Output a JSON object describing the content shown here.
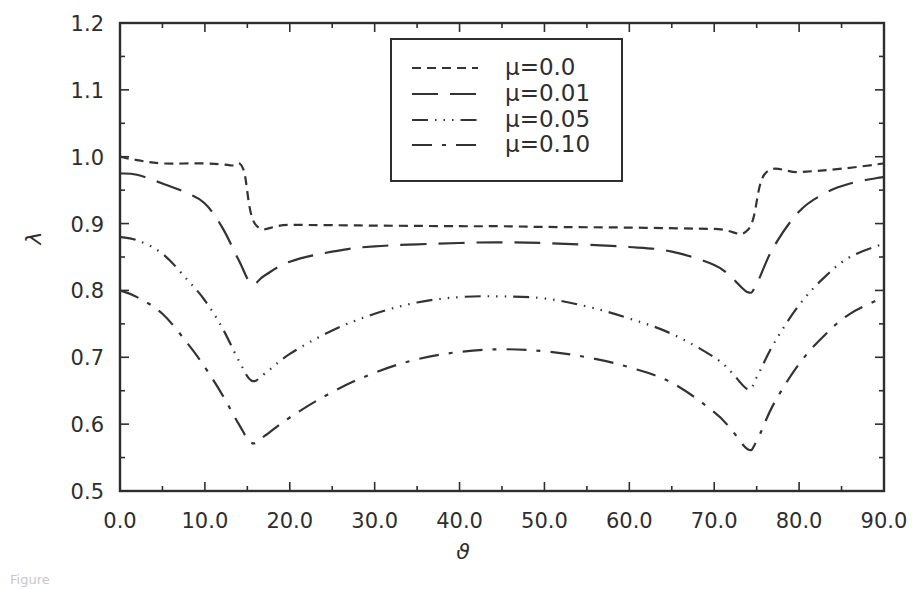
{
  "chart_data": {
    "type": "line",
    "title": "",
    "xlabel": "ϑ",
    "ylabel": "λ",
    "xlim": [
      0.0,
      90.0
    ],
    "ylim": [
      0.5,
      1.2
    ],
    "grid": false,
    "legend_position": "upper center (boxed)",
    "x_ticks": [
      "0.0",
      "10.0",
      "20.0",
      "30.0",
      "40.0",
      "50.0",
      "60.0",
      "70.0",
      "80.0",
      "90.0"
    ],
    "y_ticks": [
      "0.5",
      "0.6",
      "0.7",
      "0.8",
      "0.9",
      "1.0",
      "1.1",
      "1.2"
    ],
    "series": [
      {
        "name": "μ=0.0",
        "style": "short-dash",
        "dash": "9 6",
        "x": [
          0,
          2,
          5,
          10,
          13,
          14.5,
          16,
          20,
          30,
          40,
          45,
          50,
          60,
          70,
          74,
          76,
          80,
          85,
          90
        ],
        "y": [
          1.0,
          0.995,
          0.99,
          0.99,
          0.987,
          0.982,
          0.898,
          0.898,
          0.897,
          0.896,
          0.896,
          0.895,
          0.894,
          0.892,
          0.891,
          0.975,
          0.977,
          0.982,
          0.99
        ]
      },
      {
        "name": "μ=0.01",
        "style": "long-dash",
        "dash": "26 12",
        "x": [
          0,
          2,
          5,
          8,
          10,
          12,
          14,
          15.5,
          17,
          20,
          25,
          30,
          40,
          45,
          50,
          60,
          65,
          70,
          72,
          74,
          75,
          77,
          80,
          83,
          86,
          90
        ],
        "y": [
          0.975,
          0.973,
          0.96,
          0.945,
          0.93,
          0.895,
          0.845,
          0.81,
          0.822,
          0.843,
          0.858,
          0.866,
          0.871,
          0.872,
          0.871,
          0.865,
          0.858,
          0.838,
          0.82,
          0.797,
          0.81,
          0.865,
          0.918,
          0.945,
          0.96,
          0.97
        ]
      },
      {
        "name": "μ=0.05",
        "style": "dash-dot-dot",
        "dash": "16 7 1.5 7 1.5 7 1.5 7",
        "x": [
          0,
          2,
          5,
          8,
          10,
          12,
          14,
          15.5,
          17,
          20,
          25,
          30,
          35,
          40,
          45,
          50,
          55,
          60,
          65,
          70,
          72,
          74,
          75,
          77,
          80,
          83,
          86,
          90
        ],
        "y": [
          0.88,
          0.875,
          0.855,
          0.815,
          0.785,
          0.745,
          0.695,
          0.665,
          0.675,
          0.705,
          0.74,
          0.765,
          0.782,
          0.79,
          0.791,
          0.788,
          0.776,
          0.758,
          0.735,
          0.7,
          0.678,
          0.652,
          0.67,
          0.72,
          0.778,
          0.82,
          0.85,
          0.87
        ]
      },
      {
        "name": "μ=0.10",
        "style": "dash-dot",
        "dash": "20 10 4 10",
        "x": [
          0,
          2,
          5,
          8,
          10,
          12,
          14,
          15.5,
          17,
          20,
          25,
          30,
          35,
          40,
          45,
          50,
          55,
          60,
          65,
          70,
          72,
          74,
          75,
          77,
          80,
          83,
          86,
          90
        ],
        "y": [
          0.8,
          0.79,
          0.765,
          0.72,
          0.685,
          0.645,
          0.6,
          0.572,
          0.582,
          0.61,
          0.648,
          0.677,
          0.697,
          0.708,
          0.712,
          0.709,
          0.7,
          0.685,
          0.662,
          0.618,
          0.592,
          0.562,
          0.575,
          0.63,
          0.69,
          0.733,
          0.765,
          0.79
        ]
      }
    ]
  },
  "legend": {
    "items": [
      {
        "label": "μ=0.0"
      },
      {
        "label": "μ=0.01"
      },
      {
        "label": "μ=0.05"
      },
      {
        "label": "μ=0.10"
      }
    ]
  },
  "axes": {
    "x_title": "ϑ",
    "y_title": "λ"
  },
  "caption": "Figure"
}
